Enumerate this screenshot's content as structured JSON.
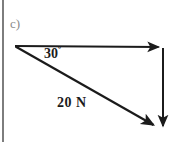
{
  "figure": {
    "part_label": "c)",
    "background_color": "#ffffff",
    "stroke_color": "#1b1b1b",
    "border_color": "#7d7d7d"
  },
  "diagram": {
    "type": "force-vector-triangle",
    "origin_label": "",
    "vectors": [
      {
        "name": "horizontal-component-vector",
        "label": "",
        "direction": "right",
        "from": [
          15,
          46
        ],
        "to": [
          163,
          47
        ]
      },
      {
        "name": "resultant-force-vector",
        "label": "20 N",
        "magnitude": "20",
        "unit": "N",
        "direction": "down-right",
        "from": [
          15,
          46
        ],
        "to": [
          158,
          128
        ]
      },
      {
        "name": "vertical-component-vector",
        "label": "",
        "direction": "down",
        "from": [
          163,
          48
        ],
        "to": [
          163,
          132
        ]
      }
    ],
    "angle": {
      "name": "angle-between-horizontal-and-resultant",
      "value": "30",
      "degree_symbol": "º",
      "label": "30º"
    },
    "magnitude_label": "20 N"
  }
}
